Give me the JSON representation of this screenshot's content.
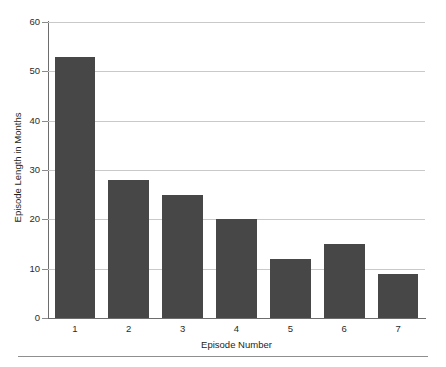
{
  "chart_data": {
    "type": "bar",
    "title": "",
    "xlabel": "Episode Number",
    "ylabel": "Episode Length in Months",
    "categories": [
      "1",
      "2",
      "3",
      "4",
      "5",
      "6",
      "7"
    ],
    "values": [
      53,
      28,
      25,
      20,
      12,
      15,
      9
    ],
    "ylim": [
      0,
      60
    ],
    "yticks": [
      0,
      10,
      20,
      30,
      40,
      50,
      60
    ],
    "ytick_labels": [
      "0",
      "10",
      "20",
      "30",
      "40",
      "50",
      "60"
    ],
    "grid": "horizontal",
    "legend": "none",
    "series": [
      {
        "name": "Episode Length in Months",
        "values": [
          53,
          28,
          25,
          20,
          12,
          15,
          9
        ]
      }
    ],
    "colors": {
      "bar_fill": "#474747",
      "gridline": "#c9c9c9",
      "axis_line": "#6d6d6d",
      "text": "#231f20",
      "background": "#ffffff",
      "bottom_rule": "#8f8f8f"
    }
  }
}
